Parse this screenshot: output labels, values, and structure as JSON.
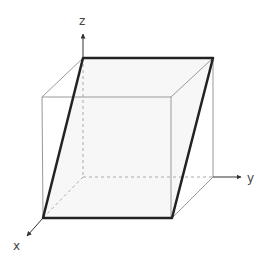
{
  "diagram": {
    "type": "sheared-cube",
    "axes": {
      "x_label": "x",
      "y_label": "y",
      "z_label": "z"
    },
    "colors": {
      "thin_edge": "#999999",
      "bold_edge": "#222222",
      "dashed_edge": "#aaaaaa",
      "face_fill": "#f4f4f4"
    }
  }
}
